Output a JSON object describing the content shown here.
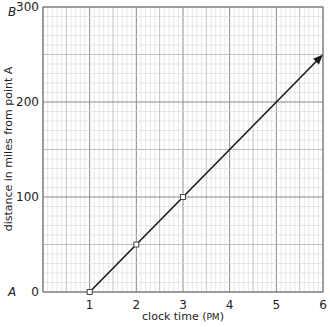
{
  "chart_data": {
    "type": "line",
    "title": "",
    "xlabel": "clock time (PM)",
    "xlabel_main": "clock time (",
    "xlabel_unit": "PM",
    "xlabel_close": ")",
    "ylabel": "distance in miles from point A",
    "x_ticks": [
      "1",
      "2",
      "3",
      "4",
      "5",
      "6"
    ],
    "y_ticks": [
      "0",
      "100",
      "200",
      "300"
    ],
    "xlim": [
      0,
      6
    ],
    "ylim": [
      0,
      300
    ],
    "grid": true,
    "legend": null,
    "point_labels": {
      "origin": "A",
      "top": "B"
    },
    "series": [
      {
        "name": "distance",
        "x": [
          1,
          2,
          3,
          6
        ],
        "y": [
          0,
          50,
          100,
          250
        ],
        "marked_points": [
          [
            1,
            0
          ],
          [
            2,
            50
          ],
          [
            3,
            100
          ]
        ],
        "arrow_end": true
      }
    ]
  }
}
